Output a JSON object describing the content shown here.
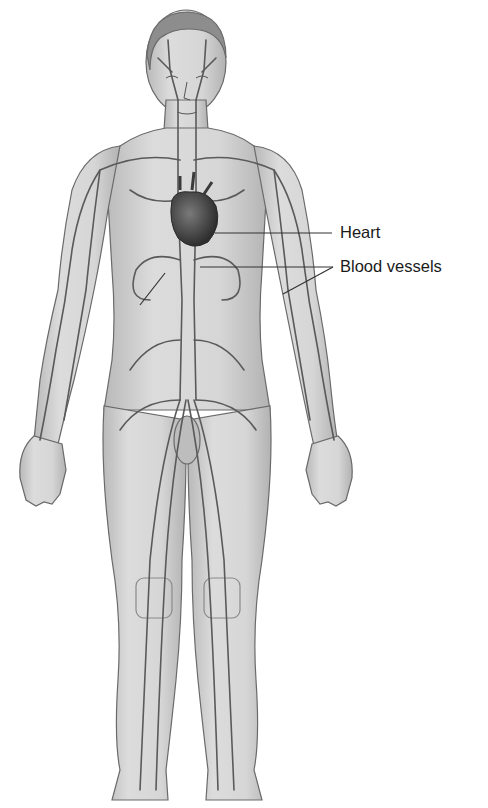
{
  "diagram": {
    "colors": {
      "background": "#ffffff",
      "skin_fill": "#cfcfcf",
      "skin_outline": "#6a6a6a",
      "vessel": "#5a5a5a",
      "heart": "#3d3d3d",
      "leader_line": "#333333",
      "label_text": "#1a1a1a"
    },
    "labels": [
      {
        "id": "heart",
        "text": "Heart",
        "x": 340,
        "y": 224,
        "targets": [
          [
            215,
            233
          ]
        ]
      },
      {
        "id": "blood-vessels",
        "text": "Blood vessels",
        "x": 340,
        "y": 258,
        "targets": [
          [
            200,
            267
          ],
          [
            283,
            294
          ]
        ]
      }
    ]
  }
}
